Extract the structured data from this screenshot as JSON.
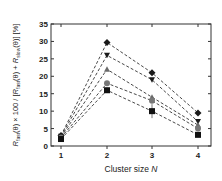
{
  "chart_data": {
    "type": "line",
    "title": "",
    "xlabel": "Cluster size N",
    "ylabel": "R_fast(θ) × 100 / [R_fast(θ) + R_slow(θ)] [%]",
    "ylabel_parts": {
      "r1": "R",
      "s1": "fast",
      "p1": "(θ) × 100 / [",
      "r2": "R",
      "s2": "fast",
      "p2": "(θ) + ",
      "r3": "R",
      "s3": "slow",
      "p3": "(θ)] [%]"
    },
    "x": [
      1,
      2,
      3,
      4
    ],
    "xticks": [
      "1",
      "2",
      "3",
      "4"
    ],
    "yticks": [
      "0",
      "5",
      "10",
      "15",
      "20",
      "25",
      "30",
      "35"
    ],
    "ylim": [
      0,
      35
    ],
    "xlim": [
      0.75,
      4.3
    ],
    "grid": false,
    "legend": null,
    "line_style": "dashed",
    "series": [
      {
        "name": "diamond",
        "marker": "diamond",
        "color": "#1a1a1a",
        "values": [
          3.0,
          29.7,
          21.0,
          9.5
        ]
      },
      {
        "name": "down-triangle",
        "marker": "triangle-down",
        "color": "#1a1a1a",
        "values": [
          2.8,
          26.0,
          19.0,
          7.0
        ]
      },
      {
        "name": "up-triangle",
        "marker": "triangle-up",
        "color": "#6a6a6a",
        "values": [
          2.6,
          22.0,
          14.0,
          6.0
        ]
      },
      {
        "name": "circle",
        "marker": "circle",
        "color": "#777777",
        "values": [
          2.4,
          18.0,
          13.0,
          5.0
        ]
      },
      {
        "name": "square",
        "marker": "square",
        "color": "#111111",
        "values": [
          2.0,
          16.0,
          10.0,
          3.2
        ],
        "error": [
          0.5,
          0.8,
          2.0,
          0.6
        ]
      }
    ]
  }
}
